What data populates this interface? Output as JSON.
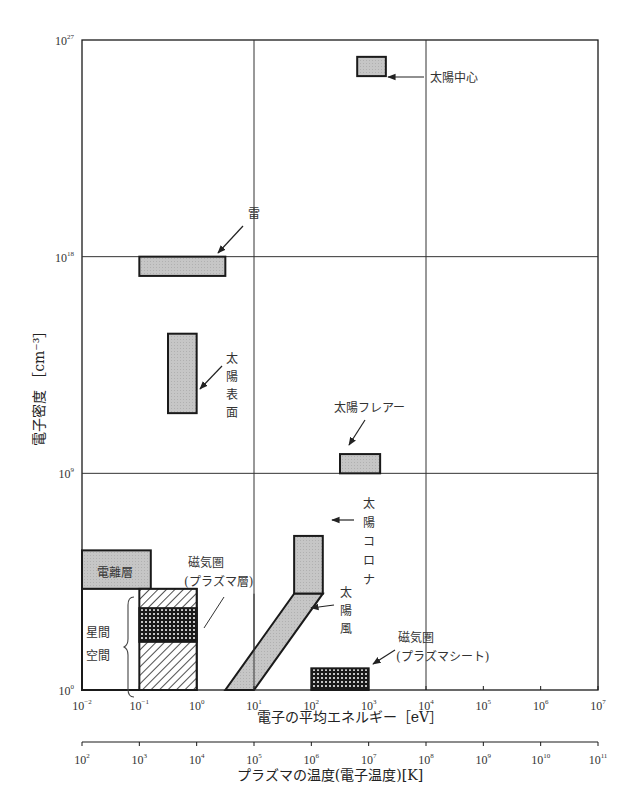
{
  "chart_data": {
    "type": "region-diagram",
    "title": "",
    "xlabel": "電子の平均エネルギー [eV]",
    "xlabel_secondary": "プラズマの温度(電子温度)[K]",
    "ylabel": "電子密度 [cm⁻³]",
    "x_scale": "log",
    "y_scale": "log",
    "xlim_log10": [
      -2,
      7
    ],
    "ylim_log10": [
      0,
      27
    ],
    "x_secondary_lim_log10": [
      2,
      11
    ],
    "x_ticks": [
      {
        "base": "10",
        "exp": "-2",
        "value": -2
      },
      {
        "base": "10",
        "exp": "-1",
        "value": -1
      },
      {
        "base": "10",
        "exp": "0",
        "value": 0
      },
      {
        "base": "10",
        "exp": "1",
        "value": 1
      },
      {
        "base": "10",
        "exp": "2",
        "value": 2
      },
      {
        "base": "10",
        "exp": "3",
        "value": 3
      },
      {
        "base": "10",
        "exp": "4",
        "value": 4
      },
      {
        "base": "10",
        "exp": "5",
        "value": 5
      },
      {
        "base": "10",
        "exp": "6",
        "value": 6
      },
      {
        "base": "10",
        "exp": "7",
        "value": 7
      }
    ],
    "x_secondary_ticks": [
      {
        "base": "10",
        "exp": "2",
        "value": 2
      },
      {
        "base": "10",
        "exp": "3",
        "value": 3
      },
      {
        "base": "10",
        "exp": "4",
        "value": 4
      },
      {
        "base": "10",
        "exp": "5",
        "value": 5
      },
      {
        "base": "10",
        "exp": "6",
        "value": 6
      },
      {
        "base": "10",
        "exp": "7",
        "value": 7
      },
      {
        "base": "10",
        "exp": "8",
        "value": 8
      },
      {
        "base": "10",
        "exp": "9",
        "value": 9
      },
      {
        "base": "10",
        "exp": "10",
        "value": 10
      },
      {
        "base": "10",
        "exp": "11",
        "value": 11
      }
    ],
    "y_ticks": [
      {
        "base": "10",
        "exp": "0",
        "value": 0
      },
      {
        "base": "10",
        "exp": "9",
        "value": 9
      },
      {
        "base": "10",
        "exp": "18",
        "value": 18
      },
      {
        "base": "10",
        "exp": "27",
        "value": 27
      }
    ],
    "grid": {
      "x_log10": [
        1,
        4
      ],
      "y_log10": [
        9,
        18
      ]
    },
    "regions": [
      {
        "name": "太陽中心",
        "shape": "rect",
        "fill": "gray",
        "x_log10": [
          2.8,
          3.3
        ],
        "y_log10": [
          25.5,
          26.3
        ]
      },
      {
        "name": "雷",
        "shape": "rect",
        "fill": "gray",
        "x_log10": [
          -1.0,
          0.5
        ],
        "y_log10": [
          17.2,
          18.0
        ]
      },
      {
        "name": "太陽表面",
        "shape": "rect",
        "fill": "gray",
        "x_log10": [
          -0.5,
          0.0
        ],
        "y_log10": [
          11.5,
          14.8
        ]
      },
      {
        "name": "太陽フレアー",
        "shape": "rect",
        "fill": "gray",
        "x_log10": [
          2.5,
          3.2
        ],
        "y_log10": [
          9.0,
          9.8
        ]
      },
      {
        "name": "太陽コロナ",
        "shape": "rect",
        "fill": "gray",
        "x_log10": [
          1.7,
          2.2
        ],
        "y_log10": [
          4.0,
          6.4
        ]
      },
      {
        "name": "太陽風",
        "shape": "polygon",
        "fill": "gray",
        "points_log10": [
          [
            0.5,
            0
          ],
          [
            1.0,
            0
          ],
          [
            2.2,
            4.0
          ],
          [
            1.7,
            4.0
          ]
        ]
      },
      {
        "name": "電離層",
        "shape": "rect",
        "fill": "gray",
        "x_log10": [
          -2.0,
          -0.8
        ],
        "y_log10": [
          4.2,
          5.8
        ]
      },
      {
        "name": "星間空間",
        "shape": "rect",
        "fill": "white",
        "x_log10": [
          -2.0,
          0.0
        ],
        "y_log10": [
          0.0,
          4.2
        ]
      },
      {
        "name": "磁気圏(プラズマ層)",
        "shape": "rect",
        "fill": "hatch",
        "x_log10": [
          -1.0,
          0.0
        ],
        "y_log10": [
          0.0,
          4.2
        ]
      },
      {
        "name": "磁気圏(プラズマ層) dense band",
        "shape": "rect",
        "fill": "crosshatch",
        "x_log10": [
          -1.0,
          0.0
        ],
        "y_log10": [
          2.0,
          3.4
        ]
      },
      {
        "name": "磁気圏(プラズマシート)",
        "shape": "rect",
        "fill": "crosshatch",
        "x_log10": [
          2.0,
          3.0
        ],
        "y_log10": [
          0.0,
          0.9
        ]
      }
    ]
  },
  "labels": {
    "sun_core": "太陽中心",
    "lightning": "雷",
    "sun_surface": [
      "太",
      "陽",
      "表",
      "面"
    ],
    "solar_flare": "太陽フレアー",
    "corona": [
      "太",
      "陽",
      "コ",
      "ロ",
      "ナ"
    ],
    "solar_wind": [
      "太",
      "陽",
      "風"
    ],
    "ionosphere": "電離層",
    "interstellar": [
      "星間",
      "空間"
    ],
    "plasmasphere": [
      "磁気圏",
      "(プラズマ層)"
    ],
    "plasmasheet": [
      "磁気圏",
      "(プラズマシート)"
    ],
    "xlabel": "電子の平均エネルギー［eV］",
    "xlabel2": "プラズマの温度(電子温度)[K]",
    "ylabel_jp": "電子密度",
    "ylabel_unit": "［cm⁻³］"
  },
  "colors": {
    "gray_fill": "#c4c4c4",
    "line": "#1a1a1a",
    "grid": "#333333"
  }
}
